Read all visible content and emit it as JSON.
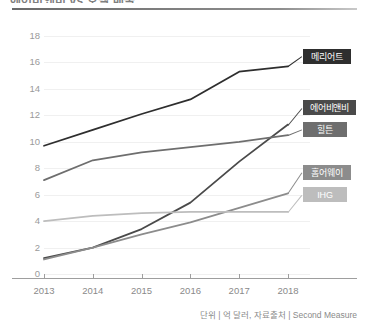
{
  "title": "에어비앤비 vs 호텔 매출",
  "source_note": "단위 | 억 달러, 자료출처 | Second Measure",
  "axis": {
    "y_ticks": [
      "0",
      "2",
      "4",
      "6",
      "8",
      "10",
      "12",
      "14",
      "16",
      "18"
    ],
    "x_ticks": [
      "2013",
      "2014",
      "2015",
      "2016",
      "2017",
      "2018"
    ]
  },
  "legend": {
    "marriott": "메리어트",
    "airbnb": "에어비앤비",
    "hilton": "힐튼",
    "homeaway": "홈어웨이",
    "ihg": "IHG"
  },
  "chart_data": {
    "type": "line",
    "title": "에어비앤비 vs 호텔 매출",
    "xlabel": "",
    "ylabel": "",
    "unit": "억 달러",
    "source": "Second Measure",
    "x": [
      "2013",
      "2014",
      "2015",
      "2016",
      "2017",
      "2018"
    ],
    "xlim": [
      2013,
      2018
    ],
    "ylim": [
      0,
      18
    ],
    "ytick_step": 2,
    "grid": true,
    "legend_position": "right-inline-labels",
    "series": [
      {
        "name": "메리어트",
        "color": "#2e2e2e",
        "label_bg": "#2e2e2e",
        "label_text_color": "#ffffff",
        "values": [
          9.7,
          10.9,
          12.1,
          13.2,
          15.3,
          15.7
        ]
      },
      {
        "name": "에어비앤비",
        "color": "#4a4a4a",
        "label_bg": "#4a4a4a",
        "label_text_color": "#ffffff",
        "values": [
          1.2,
          2.0,
          3.4,
          5.4,
          8.5,
          11.3
        ]
      },
      {
        "name": "힐튼",
        "color": "#6e6e6e",
        "label_bg": "#6e6e6e",
        "label_text_color": "#ffffff",
        "values": [
          7.1,
          8.6,
          9.2,
          9.6,
          10.0,
          10.5
        ]
      },
      {
        "name": "홈어웨이",
        "color": "#8c8c8c",
        "label_bg": "#8c8c8c",
        "label_text_color": "#ffffff",
        "values": [
          1.1,
          2.0,
          3.0,
          3.9,
          5.0,
          6.1
        ]
      },
      {
        "name": "IHG",
        "color": "#bdbdbd",
        "label_bg": "#bdbdbd",
        "label_text_color": "#ffffff",
        "values": [
          4.0,
          4.4,
          4.6,
          4.7,
          4.7,
          4.7
        ]
      }
    ]
  },
  "colors": {
    "grid": "#f0f0f0",
    "axis": "#9e9e9e",
    "tick_text": "#8a8a8a",
    "title_rule": "#6a6a6a"
  }
}
